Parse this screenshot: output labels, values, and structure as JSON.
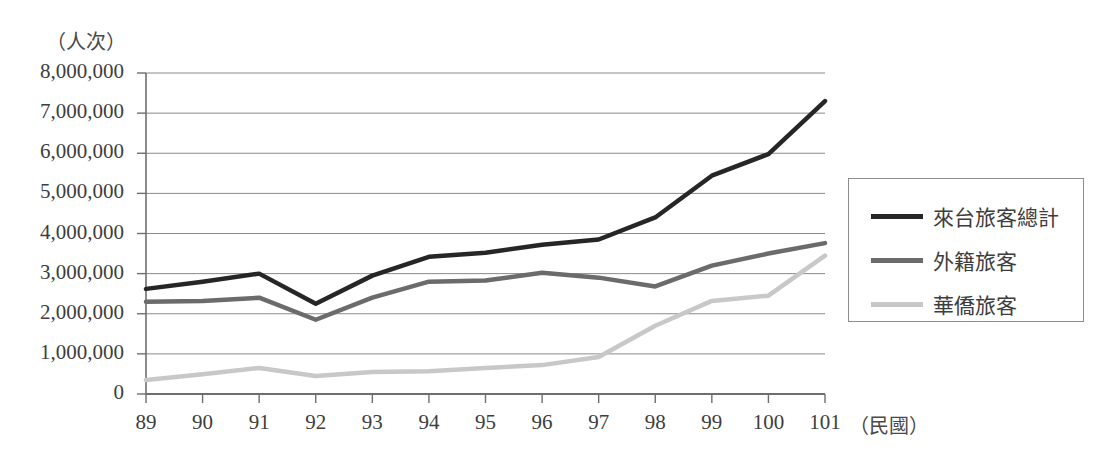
{
  "chart_data": {
    "type": "line",
    "title": "",
    "xlabel": "（民國）",
    "ylabel": "（人次）",
    "unit_label": "（人次）",
    "x_axis_caption": "（民國）",
    "categories": [
      "89",
      "90",
      "91",
      "92",
      "93",
      "94",
      "95",
      "96",
      "97",
      "98",
      "99",
      "100",
      "101"
    ],
    "x": [
      89,
      90,
      91,
      92,
      93,
      94,
      95,
      96,
      97,
      98,
      99,
      100,
      101
    ],
    "ylim": [
      0,
      8000000
    ],
    "ytick_values": [
      0,
      1000000,
      2000000,
      3000000,
      4000000,
      5000000,
      6000000,
      7000000,
      8000000
    ],
    "ytick_labels": [
      "0",
      "1,000,000",
      "2,000,000",
      "3,000,000",
      "4,000,000",
      "5,000,000",
      "6,000,000",
      "7,000,000",
      "8,000,000"
    ],
    "grid": true,
    "legend_position": "right",
    "series": [
      {
        "name": "來台旅客總計",
        "color": "#262626",
        "width": 4.5,
        "values": [
          2620000,
          2800000,
          3000000,
          2250000,
          2950000,
          3420000,
          3520000,
          3720000,
          3850000,
          4400000,
          5440000,
          5980000,
          7300000
        ]
      },
      {
        "name": "外籍旅客",
        "color": "#6b6b6b",
        "width": 4.5,
        "values": [
          2300000,
          2320000,
          2400000,
          1850000,
          2400000,
          2800000,
          2830000,
          3020000,
          2900000,
          2680000,
          3200000,
          3500000,
          3760000
        ]
      },
      {
        "name": "華僑旅客",
        "color": "#c8c8c8",
        "width": 4.5,
        "values": [
          350000,
          490000,
          650000,
          450000,
          550000,
          570000,
          650000,
          720000,
          920000,
          1700000,
          2320000,
          2450000,
          3450000
        ]
      }
    ]
  },
  "legend": {
    "items": [
      {
        "label": "來台旅客總計",
        "color": "#262626"
      },
      {
        "label": "外籍旅客",
        "color": "#6b6b6b"
      },
      {
        "label": "華僑旅客",
        "color": "#c8c8c8"
      }
    ]
  },
  "colors": {
    "axis": "#6e6e6e",
    "grid": "#8a8a8a",
    "text": "#3d3d3d",
    "legend_border": "#8d8d8d",
    "background": "#ffffff"
  },
  "geometry": {
    "plot_left": 146,
    "plot_right": 825,
    "plot_top": 73,
    "plot_bottom": 394,
    "legend_left": 848,
    "legend_top": 178,
    "legend_width": 236,
    "legend_height": 144
  }
}
